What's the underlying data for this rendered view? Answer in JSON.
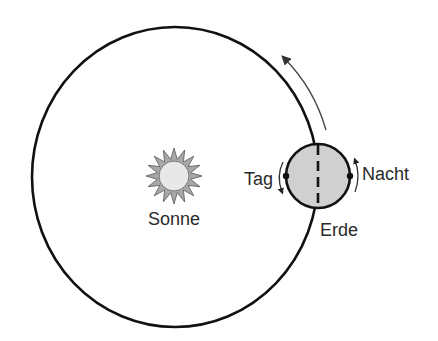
{
  "diagram": {
    "title": "",
    "labels": {
      "sun": "Sonne",
      "earth": "Erde",
      "day": "Tag",
      "night": "Nacht"
    },
    "colors": {
      "line": "#111111",
      "earth_fill": "#cfcfcf",
      "sun_disc": "#e6e6e6",
      "sun_rays": "#9a9a9a",
      "arrow": "#444444",
      "text": "#2a2a2a"
    },
    "elements": [
      {
        "id": "orbit",
        "type": "ellipse",
        "cx": 175,
        "cy": 177,
        "rx": 143,
        "ry": 150
      },
      {
        "id": "sun",
        "type": "star",
        "cx": 174,
        "cy": 176,
        "inner_r": 15,
        "outer_r": 28,
        "rays": 16
      },
      {
        "id": "earth",
        "type": "circle",
        "cx": 318,
        "cy": 176,
        "r": 32
      },
      {
        "id": "axis",
        "type": "dashed-line",
        "from": [
          318,
          144
        ],
        "to": [
          318,
          208
        ]
      },
      {
        "id": "orbit-direction-arrow",
        "type": "arc-arrow",
        "from": [
          326,
          130
        ],
        "to": [
          283,
          57
        ]
      },
      {
        "id": "day-point",
        "type": "dot",
        "cx": 286,
        "cy": 176
      },
      {
        "id": "night-point",
        "type": "dot",
        "cx": 350,
        "cy": 176
      }
    ]
  }
}
